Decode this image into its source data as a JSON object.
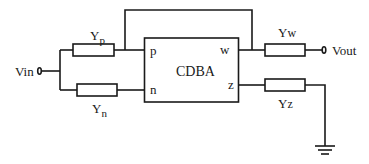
{
  "diagram": {
    "type": "circuit-schematic",
    "block": {
      "label": "CDBA",
      "ports": {
        "p": "p",
        "n": "n",
        "w": "w",
        "z": "z"
      }
    },
    "components": {
      "yp": {
        "main": "Y",
        "sub": "p"
      },
      "yn": {
        "main": "Y",
        "sub": "n"
      },
      "yw": {
        "main": "Y",
        "sub": "w"
      },
      "yz": {
        "main": "Y",
        "sub": "z"
      }
    },
    "terminals": {
      "input": "Vin",
      "output": "Vout"
    },
    "ground": "ground-symbol",
    "colors": {
      "line": "#1a1a1a",
      "background": "#ffffff"
    }
  }
}
